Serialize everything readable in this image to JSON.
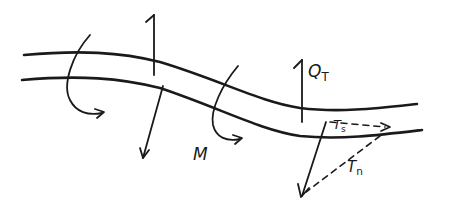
{
  "figure": {
    "colors": {
      "ink": "#1a1a1a",
      "background": "#ffffff"
    }
  },
  "labels": {
    "moment": {
      "main": "M"
    },
    "shear": {
      "main": "Q",
      "sub": "T"
    },
    "traction_s": {
      "main": "T",
      "sub": "s"
    },
    "traction_n": {
      "main": "T",
      "sub": "n"
    }
  },
  "elements": [
    {
      "kind": "beam-edge",
      "position": "upper"
    },
    {
      "kind": "beam-edge",
      "position": "lower"
    },
    {
      "kind": "moment-arrow",
      "position": "left",
      "direction": "curved-clockwise"
    },
    {
      "kind": "moment-arrow",
      "position": "middle",
      "label": "M"
    },
    {
      "kind": "force-arrow",
      "position": "left-upper",
      "direction": "up"
    },
    {
      "kind": "force-arrow",
      "position": "left-lower",
      "direction": "down"
    },
    {
      "kind": "force-arrow",
      "position": "right-upper",
      "direction": "up",
      "label": "Q_T"
    },
    {
      "kind": "force-arrow",
      "position": "right-lower",
      "direction": "down-left",
      "resultant": true
    },
    {
      "kind": "dashed-component",
      "label": "T_s",
      "direction": "tangential"
    },
    {
      "kind": "dashed-component",
      "label": "T_n",
      "direction": "normal"
    }
  ]
}
